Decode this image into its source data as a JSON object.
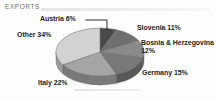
{
  "header": {
    "title": "EXPORTS",
    "rule_color": "#e6e6e6"
  },
  "chart_data": {
    "type": "pie",
    "title": "EXPORTS",
    "xlabel": "",
    "ylabel": "",
    "unit": "%",
    "total": 100,
    "legend_position": "callout-labels",
    "grid": false,
    "categories": [
      "Austria",
      "Slovenia",
      "Bosnia & Herzegovina",
      "Germany",
      "Italy",
      "Other"
    ],
    "values": [
      6,
      11,
      12,
      15,
      22,
      34
    ],
    "labels": [
      "Austria 6%",
      "Slovenia 11%",
      "Bosnia & Herzegovina 12%",
      "Germany 15%",
      "Italy 22%",
      "Other 34%"
    ],
    "slices": [
      {
        "name": "Austria",
        "value": 6,
        "label": "Austria 6%",
        "color": "#4a4a4a",
        "side_color": "#343434"
      },
      {
        "name": "Slovenia",
        "value": 11,
        "label": "Slovenia 11%",
        "color": "#6f6f6f",
        "side_color": "#505050"
      },
      {
        "name": "Bosnia & Herzegovina",
        "value": 12,
        "label": "Bosnia & Herzegovina 12%",
        "color": "#8a8a8a",
        "side_color": "#646464"
      },
      {
        "name": "Germany",
        "value": 15,
        "label": "Germany 15%",
        "color": "#787878",
        "side_color": "#575757"
      },
      {
        "name": "Italy",
        "value": 22,
        "label": "Italy 22%",
        "color": "#a5a5a5",
        "side_color": "#797979"
      },
      {
        "name": "Other",
        "value": 34,
        "label": "Other 34%",
        "color": "#d2d2d2",
        "side_color": "#9c9c9c"
      }
    ]
  },
  "callouts": {
    "austria": "Austria 6%",
    "slovenia": "Slovenia 11%",
    "bosnia": "Bosnia & Herzegovina 12%",
    "germany": "Germany 15%",
    "italy": "Italy 22%",
    "other": "Other 34%"
  }
}
